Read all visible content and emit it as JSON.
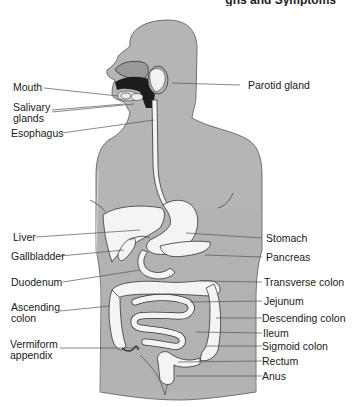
{
  "header": {
    "title_fragment": "gns and Symptoms"
  },
  "diagram": {
    "colors": {
      "body": "#b3b3b3",
      "organ": "#f4f4f4",
      "outline": "#333333",
      "leader": "#444444",
      "dark": "#1c1c1c"
    },
    "labels_left": [
      {
        "id": "mouth",
        "text": "Mouth"
      },
      {
        "id": "salivary",
        "line1": "Salivary",
        "line2": "glands"
      },
      {
        "id": "esophagus",
        "text": "Esophagus"
      },
      {
        "id": "liver",
        "text": "Liver"
      },
      {
        "id": "gallbladder",
        "text": "Gallbladder"
      },
      {
        "id": "duodenum",
        "text": "Duodenum"
      },
      {
        "id": "ascending",
        "line1": "Ascending",
        "line2": "colon"
      },
      {
        "id": "appendix",
        "line1": "Vermiform",
        "line2": "appendix"
      }
    ],
    "labels_right": [
      {
        "id": "parotid",
        "text": "Parotid gland"
      },
      {
        "id": "stomach",
        "text": "Stomach"
      },
      {
        "id": "pancreas",
        "text": "Pancreas"
      },
      {
        "id": "transverse",
        "text": "Transverse colon"
      },
      {
        "id": "jejunum",
        "text": "Jejunum"
      },
      {
        "id": "descending",
        "text": "Descending colon"
      },
      {
        "id": "ileum",
        "text": "Ileum"
      },
      {
        "id": "sigmoid",
        "text": "Sigmoid colon"
      },
      {
        "id": "rectum",
        "text": "Rectum"
      },
      {
        "id": "anus",
        "text": "Anus"
      }
    ]
  }
}
